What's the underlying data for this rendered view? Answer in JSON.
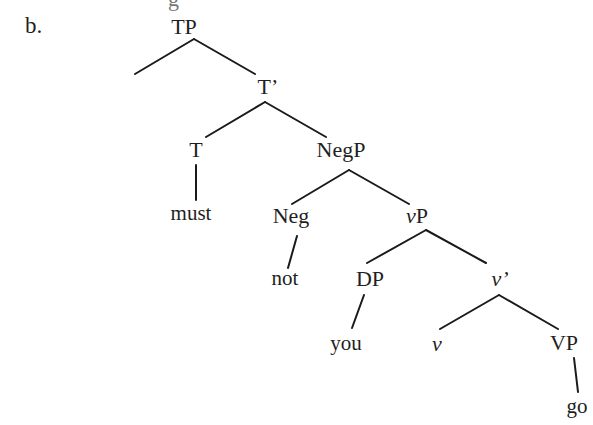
{
  "figure": {
    "label": "b.",
    "cutoff_text": "g"
  },
  "tree": {
    "nodes": {
      "TP": {
        "label": "TP",
        "x": 184,
        "y": 16
      },
      "T_bar": {
        "label": "T’",
        "x": 268,
        "y": 76
      },
      "T": {
        "label": "T",
        "x": 196,
        "y": 139
      },
      "must": {
        "label": "must",
        "x": 191,
        "y": 203
      },
      "NegP": {
        "label": "NegP",
        "x": 341,
        "y": 139
      },
      "Neg": {
        "label": "Neg",
        "x": 291,
        "y": 205
      },
      "not": {
        "label": "not",
        "x": 285,
        "y": 268
      },
      "vP": {
        "label_v": "v",
        "label_rest": "P",
        "x": 417,
        "y": 205
      },
      "DP": {
        "label": "DP",
        "x": 370,
        "y": 268
      },
      "you": {
        "label": "you",
        "x": 346,
        "y": 333
      },
      "v_bar": {
        "label": "v’",
        "x": 500,
        "y": 268
      },
      "v": {
        "label": "v",
        "x": 437,
        "y": 333
      },
      "VP": {
        "label": "VP",
        "x": 564,
        "y": 332
      },
      "go": {
        "label": "go",
        "x": 577,
        "y": 396
      }
    },
    "edges": [
      {
        "from": "TP",
        "to": "(empty-spec)",
        "x1": 194,
        "y1": 39,
        "x2": 135,
        "y2": 74
      },
      {
        "from": "TP",
        "to": "T_bar",
        "x1": 194,
        "y1": 39,
        "x2": 255,
        "y2": 74
      },
      {
        "from": "T_bar",
        "to": "T",
        "x1": 265,
        "y1": 102,
        "x2": 206,
        "y2": 137
      },
      {
        "from": "T_bar",
        "to": "NegP",
        "x1": 265,
        "y1": 102,
        "x2": 326,
        "y2": 137
      },
      {
        "from": "T",
        "to": "must",
        "x1": 196,
        "y1": 165,
        "x2": 196,
        "y2": 200
      },
      {
        "from": "NegP",
        "to": "Neg",
        "x1": 349,
        "y1": 170,
        "x2": 292,
        "y2": 204
      },
      {
        "from": "NegP",
        "to": "vP",
        "x1": 349,
        "y1": 170,
        "x2": 409,
        "y2": 204
      },
      {
        "from": "Neg",
        "to": "not",
        "x1": 297,
        "y1": 236,
        "x2": 288,
        "y2": 268
      },
      {
        "from": "vP",
        "to": "DP",
        "x1": 426,
        "y1": 230,
        "x2": 367,
        "y2": 263
      },
      {
        "from": "vP",
        "to": "v_bar",
        "x1": 426,
        "y1": 230,
        "x2": 486,
        "y2": 263
      },
      {
        "from": "DP",
        "to": "you",
        "x1": 364,
        "y1": 295,
        "x2": 352,
        "y2": 328
      },
      {
        "from": "v_bar",
        "to": "v",
        "x1": 499,
        "y1": 295,
        "x2": 440,
        "y2": 329
      },
      {
        "from": "v_bar",
        "to": "VP",
        "x1": 499,
        "y1": 295,
        "x2": 558,
        "y2": 329
      },
      {
        "from": "VP",
        "to": "go",
        "x1": 574,
        "y1": 358,
        "x2": 578,
        "y2": 392
      }
    ]
  }
}
